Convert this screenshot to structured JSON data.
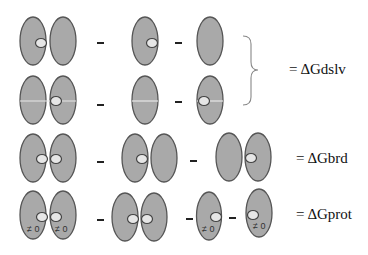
{
  "diagram": {
    "colors": {
      "domain_fill": "#a9a9a9",
      "domain_stroke": "#555555",
      "bead_fill": "#e6e6e6",
      "bead_stroke": "#444444",
      "minus": "#222222",
      "brace": "#888888"
    },
    "operators": {
      "minus": "-",
      "equals": "="
    },
    "rows": [
      {
        "id": "row-1",
        "terms": [
          "pair-bead-on-left-domain",
          "single-bead-right",
          "single-empty"
        ],
        "shared_label_group": "dslv"
      },
      {
        "id": "row-2",
        "terms": [
          "pair-linked-bead-on-right-domain",
          "single-linked-empty",
          "single-linked-bead-left"
        ],
        "shared_label_group": "dslv"
      },
      {
        "id": "row-3",
        "terms": [
          "pair-two-beads",
          "pair-bead-on-left-domain",
          "pair-bead-on-right-domain"
        ],
        "label": "= ΔGbrd"
      },
      {
        "id": "row-4",
        "terms": [
          "pair-two-beads-nonzero",
          "pair-two-beads",
          "single-bead-right-nonzero",
          "single-bead-left-nonzero"
        ],
        "label": "= ΔGprot"
      }
    ],
    "labels": {
      "dslv": "= ΔGdslv",
      "brd": "= ΔGbrd",
      "prot": "= ΔGprot",
      "nonzero": "≠ 0"
    }
  }
}
